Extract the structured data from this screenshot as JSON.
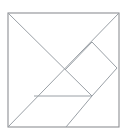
{
  "figure": {
    "canvas": {
      "width": 128,
      "height": 134
    },
    "colors": {
      "background": "#ffffff",
      "outline_stroke": "#8e9094",
      "cut_stroke": "#9aa0a6",
      "fill": "#ffffff"
    },
    "stroke_widths": {
      "outline": 1.1,
      "cut": 1.0
    },
    "square": {
      "label": "tangram square outline",
      "left": 8,
      "top": 13,
      "right": 119,
      "bottom": 127
    },
    "vertices": {
      "top_left": "8,13",
      "top_right": "119,13",
      "bottom_left": "8,127",
      "bottom_right": "119,127",
      "center": "65,70",
      "right_upper_notch": "92,42",
      "right_edge_mid": "117,68",
      "horizontal_left": "34,96",
      "horizontal_right": "92,96",
      "bottom_edge_cut": "66,127"
    },
    "cuts": [
      {
        "name": "diagonal-top-left-to-bottom-right-area",
        "from": "8,13",
        "to": "92,96"
      },
      {
        "name": "diagonal-top-right-to-bottom-left",
        "from": "119,13",
        "to": "8,127"
      },
      {
        "name": "horizontal-mid-low",
        "from": "34,96",
        "to": "92,96"
      },
      {
        "name": "cut-right-notch-upper",
        "from": "92,42",
        "to": "117,68"
      },
      {
        "name": "cut-right-notch-lower",
        "from": "92,42",
        "to": "65,70"
      },
      {
        "name": "cut-right-lower-edge",
        "from": "117,68",
        "to": "92,96"
      },
      {
        "name": "cut-bottom-diagonal",
        "from": "92,96",
        "to": "66,127"
      }
    ],
    "pieces": [
      {
        "name": "large-triangle-upper-left",
        "points": "8,13 65,70 8,127"
      },
      {
        "name": "large-triangle-upper-right",
        "points": "8,13 119,13 65,70"
      },
      {
        "name": "medium-triangle-right",
        "points": "119,13 117,68 92,42"
      },
      {
        "name": "small-triangle-center",
        "points": "65,70 92,42 92,96"
      },
      {
        "name": "square-piece",
        "points": "92,42 117,68 92,96 65,70"
      },
      {
        "name": "small-triangle-lower",
        "points": "34,96 92,96 65,127"
      },
      {
        "name": "parallelogram-lower-right",
        "points": "92,96 119,127 66,127"
      }
    ]
  }
}
